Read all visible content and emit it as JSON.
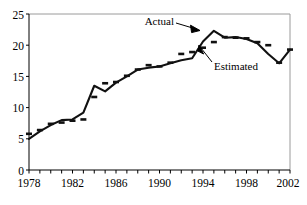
{
  "chart_data": {
    "type": "line",
    "title": "",
    "xlabel": "",
    "ylabel": "",
    "xlim": [
      1978,
      2002
    ],
    "ylim": [
      0,
      25
    ],
    "y_ticks": [
      0,
      5,
      10,
      15,
      20,
      25
    ],
    "x_ticks_labeled": [
      1978,
      1982,
      1986,
      1990,
      1994,
      1998,
      2002
    ],
    "x_tick_step_minor": 1,
    "grid": false,
    "legend_position": "annotations-inline",
    "x": [
      1978,
      1979,
      1980,
      1981,
      1982,
      1983,
      1984,
      1985,
      1986,
      1987,
      1988,
      1989,
      1990,
      1991,
      1992,
      1993,
      1994,
      1995,
      1996,
      1997,
      1998,
      1999,
      2000,
      2001,
      2002
    ],
    "series": [
      {
        "name": "Actual",
        "style": "solid",
        "values": [
          5.0,
          6.2,
          7.2,
          8.0,
          8.1,
          9.2,
          13.5,
          12.6,
          14.0,
          15.0,
          16.1,
          16.4,
          16.6,
          17.1,
          17.6,
          17.9,
          20.6,
          22.3,
          21.2,
          21.3,
          21.0,
          20.3,
          18.6,
          17.1,
          19.3
        ]
      },
      {
        "name": "Estimated",
        "style": "dashed",
        "values": [
          5.8,
          6.4,
          7.4,
          7.6,
          7.9,
          8.1,
          11.7,
          13.9,
          14.1,
          15.1,
          16.1,
          16.8,
          16.6,
          17.2,
          18.6,
          18.9,
          19.6,
          20.5,
          21.3,
          21.2,
          21.1,
          20.5,
          20.0,
          17.2,
          19.3
        ]
      }
    ],
    "annotations": [
      {
        "text": "Actual",
        "points_to_year": 1994,
        "points_to_value": 22.3
      },
      {
        "text": "Estimated",
        "points_to_year": 1995,
        "points_to_value": 20.5
      }
    ]
  },
  "axis": {
    "y_labels": [
      "25",
      "20",
      "15",
      "10",
      "5",
      "0"
    ],
    "x_labels": [
      "1978",
      "1982",
      "1986",
      "1990",
      "1994",
      "1998",
      "2002"
    ]
  },
  "annotations": {
    "actual_label": "Actual",
    "estimated_label": "Estimated"
  },
  "colors": {
    "line": "#111111",
    "axis": "#000000",
    "frame": "#9a9a9a",
    "background": "#ffffff"
  }
}
